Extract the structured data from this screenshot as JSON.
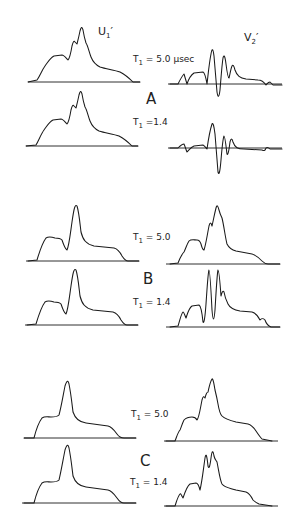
{
  "figure": {
    "column_labels": {
      "left": {
        "main": "U",
        "sub": "1",
        "prime": "′"
      },
      "right": {
        "main": "V",
        "sub": "2",
        "prime": "′"
      }
    },
    "sections": [
      {
        "letter": "A",
        "rows": [
          {
            "t_label_main": "T",
            "t_label_sub": "1",
            "t_label_value": " = 5.0 μsec"
          },
          {
            "t_label_main": "T",
            "t_label_sub": "1",
            "t_label_value": " =1.4"
          }
        ]
      },
      {
        "letter": "B",
        "rows": [
          {
            "t_label_main": "T",
            "t_label_sub": "1",
            "t_label_value": " = 5.0"
          },
          {
            "t_label_main": "T",
            "t_label_sub": "1",
            "t_label_value": " = 1.4"
          }
        ]
      },
      {
        "letter": "C",
        "rows": [
          {
            "t_label_main": "T",
            "t_label_sub": "1",
            "t_label_value": " = 5.0"
          },
          {
            "t_label_main": "T",
            "t_label_sub": "1",
            "t_label_value": " = 1.4"
          }
        ]
      }
    ],
    "waveforms": {
      "A_U1_T5": "M28,82 L37,80 C40,76 42,70 45,66 C48,62 50,58 54,56 L62,55 C64,55 66,58 68,60 C70,58 71,52 72,46 C73,42 74,40 75,42 L77,44 C78,40 79,36 80,31 C81,27 82,26 83,30 C84,36 85,40 86,43 C88,46 89,52 91,57 C93,62 96,65 100,67 C106,69 114,70 120,72 C126,75 130,79 133,82 L140,82",
      "A_V2_T5": "M170,84 L178,84 C180,80 182,76 184,74 L187,84 C189,78 191,75 194,73 L203,72 C205,73 206,78 207,84 C208,76 209,64 211,54 C212,48 213,48 214,56 C215,68 216,80 217,92 C218,98 219,98 220,90 C221,78 222,64 223,58 C224,54 225,56 226,64 C227,72 228,78 229,78 C230,74 231,68 232,66 C233,64 234,66 235,70 C237,76 240,78 246,79 L258,80 C262,80 264,82 266,85 C267,84 268,82 270,82 L273,85 L282,85",
      "A_V2_T14": "M170,148 L178,148 C180,146 182,144 184,144 C185,146 186,150 187,152 C189,150 191,147 194,146 L203,145 C205,146 206,148 207,149 C208,142 210,130 212,124 C213,122 214,126 215,134 C216,146 217,160 218,172 C219,176 220,172 221,160 C222,148 223,138 224,136 C225,136 226,146 227,154 C228,156 229,150 230,142 C231,138 232,138 233,142 C235,148 238,149 244,149 L262,150 C264,151 265,151 266,148 C267,147 268,147 270,149 L282,149",
      "B_U1_T5": "M28,261 L37,260 C40,250 43,242 46,238 C49,236 52,237 55,238 C58,238 60,238 62,240 C64,246 65,249 67,250 C69,246 70,236 72,222 C74,208 75,204 77,206 C79,212 80,224 81,232 C83,240 86,244 94,246 L114,248 C118,249 120,252 122,256 C124,259 126,261 128,261 L139,261",
      "B_V2_T5": "M170,264 L178,263 C180,258 182,254 184,252 C186,248 187,244 189,241 C191,239 194,240 197,240 C199,240 200,241 201,244 C202,248 203,250 204,250 C206,244 207,236 209,226 C210,222 211,222 212,226 C213,222 214,216 216,208 C217,204 218,206 219,210 C220,214 221,216 222,218 C224,226 225,236 227,244 C229,248 232,250 236,251 L252,254 C256,255 259,258 262,261 C264,263 266,264 268,264 L280,264",
      "B_U1_T14": "M27,325 L36,324 C39,314 42,306 45,302 C48,300 51,301 54,302 C57,302 59,302 61,304 C63,310 64,313 66,314 C68,310 69,300 71,286 C73,272 74,268 76,270 C78,276 79,288 80,296 C82,304 85,308 93,310 L113,312 C117,313 119,316 121,320 C123,323 125,325 127,325 L138,325",
      "B_V2_T14": "M170,327 L178,326 C180,320 181,314 183,312 C184,312 185,316 186,318 C188,312 189,308 192,306 L199,305 C201,306 202,312 203,322 C204,324 205,318 206,304 C207,290 208,272 209,270 C210,270 211,290 212,310 C213,322 214,322 215,310 C216,294 217,274 218,270 C219,270 220,282 221,296 C222,292 223,290 224,292 C225,298 226,300 228,304 C230,308 234,310 240,311 L252,312 C256,313 258,316 260,320 C262,318 263,318 265,320 C266,323 268,326 271,327 L280,327",
      "C_U1_T5": "M24,438 L34,438 C36,430 39,422 42,418 C45,416 48,417 51,417 C54,417 57,417 59,415 C61,408 63,396 65,386 C67,380 68,380 69,384 C71,394 72,404 73,412 C75,418 78,422 86,423 L108,426 C112,427 114,430 117,434 C119,437 121,438 124,438 L136,438",
      "C_V2_T5": "M166,441 L175,441 C177,436 178,432 180,430 C181,428 182,424 184,420 C186,418 189,417 192,417 C194,417 196,418 197,420 C199,418 200,410 202,400 C203,396 204,396 205,398 C206,394 207,392 208,392 C209,388 210,382 212,379 C213,378 214,384 215,390 C216,394 217,398 218,404 C219,410 220,414 222,416 C224,418 228,420 236,422 L248,424 C252,425 254,428 256,431 C258,434 260,437 262,439 L272,441",
      "C_U1_T14": "M24,503 L34,503 C36,495 39,487 42,483 C45,481 48,482 51,482 C54,482 57,482 59,480 C61,472 63,460 65,450 C67,444 68,444 69,448 C71,458 72,468 73,476 C75,482 78,486 86,487 L108,490 C112,491 114,494 117,498 C119,501 121,503 124,503 L136,503",
      "C_V2_T14": "M166,506 L175,506 C177,500 178,496 180,494 C181,493 182,497 183,498 C185,492 187,486 190,484 L196,483 C198,483 199,486 200,490 C202,482 203,472 205,458 C206,452 207,456 208,466 C209,470 210,466 211,458 C212,450 213,450 214,456 C215,460 216,460 217,462 C219,472 220,480 222,484 C225,488 230,488 236,490 L246,492 C249,493 251,496 253,500 C255,502 257,503 259,504 L272,506"
    },
    "baselines": [
      {
        "x1": 28,
        "x2": 140,
        "y": 82
      },
      {
        "x1": 168,
        "x2": 282,
        "y": 84
      },
      {
        "x1": 26,
        "x2": 138,
        "y": 146
      },
      {
        "x1": 168,
        "x2": 282,
        "y": 148
      },
      {
        "x1": 26,
        "x2": 139,
        "y": 261
      },
      {
        "x1": 166,
        "x2": 280,
        "y": 264
      },
      {
        "x1": 25,
        "x2": 138,
        "y": 325
      },
      {
        "x1": 166,
        "x2": 280,
        "y": 327
      },
      {
        "x1": 24,
        "x2": 136,
        "y": 438
      },
      {
        "x1": 164,
        "x2": 278,
        "y": 441
      },
      {
        "x1": 22,
        "x2": 136,
        "y": 503
      },
      {
        "x1": 164,
        "x2": 278,
        "y": 506
      }
    ],
    "A_U1_T14_path": "M26,146 L36,145 C39,140 41,134 44,130 C47,126 49,122 53,120 L61,119 C63,119 65,122 67,124 C69,122 70,116 71,110 C72,106 73,104 74,106 L76,108 C77,104 78,100 79,95 C80,91 81,90 82,94 C83,100 84,104 85,107 C87,110 88,116 90,121 C92,126 95,129 99,131 C105,133 113,134 119,136 C125,139 129,143 132,146 L138,146"
  }
}
